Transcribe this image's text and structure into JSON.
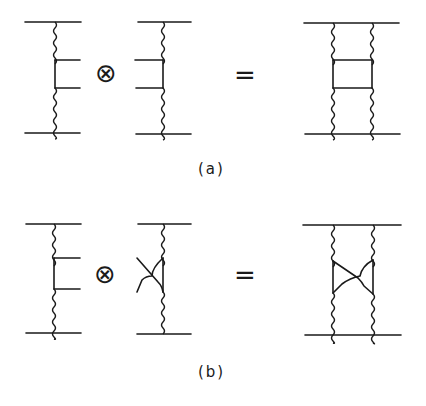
{
  "figure": {
    "panels": [
      {
        "id": "a",
        "caption": "(a)",
        "operator_tensor": "⊗",
        "operator_equals": "=",
        "left_term": "ladder-half with two rungs (right-facing)",
        "middle_term": "ladder-half with two rungs (left-facing)",
        "result": "two-rung ladder (box) diagram"
      },
      {
        "id": "b",
        "caption": "(b)",
        "operator_tensor": "⊗",
        "operator_equals": "=",
        "left_term": "ladder-half with two rungs (right-facing)",
        "middle_term": "crossed half-diagram",
        "result": "crossed-box diagram"
      }
    ],
    "colors": {
      "ink": "#1a1a1a",
      "background": "#ffffff"
    }
  }
}
